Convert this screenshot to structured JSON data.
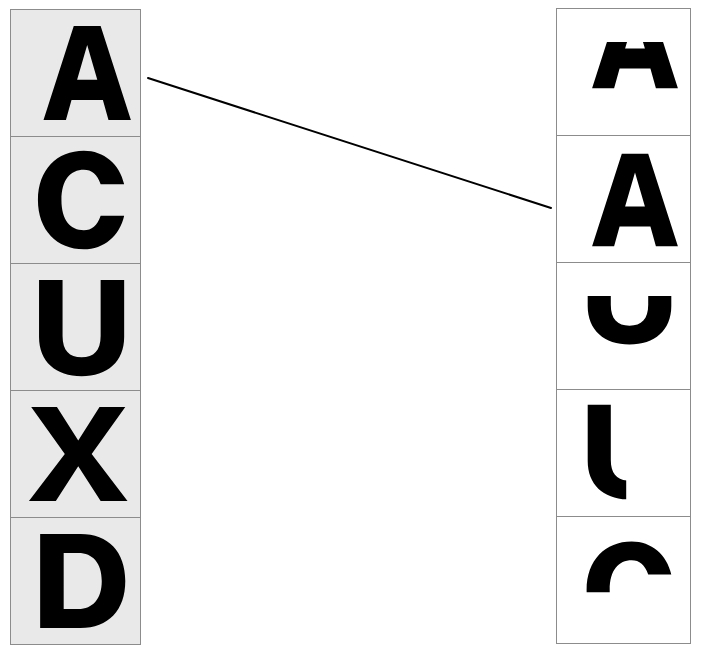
{
  "task": {
    "type": "letter-matching",
    "description": "Two vertical columns of letter cells joined by a connector line"
  },
  "left_column": {
    "name": "left-letter-column",
    "background_color": "#e9e9e9",
    "border_color": "#8c8c8c",
    "cells": [
      {
        "letter": "A",
        "clip": "full",
        "label": "A"
      },
      {
        "letter": "C",
        "clip": "full",
        "label": "C"
      },
      {
        "letter": "U",
        "clip": "full",
        "label": "U"
      },
      {
        "letter": "X",
        "clip": "full",
        "label": "X"
      },
      {
        "letter": "D",
        "clip": "full",
        "label": "D"
      }
    ]
  },
  "right_column": {
    "name": "right-letter-column",
    "background_color": "#ffffff",
    "border_color": "#8c8c8c",
    "cells": [
      {
        "letter": "A",
        "clip": "bottom-half",
        "label": "A"
      },
      {
        "letter": "A",
        "clip": "full",
        "label": "A"
      },
      {
        "letter": "U",
        "clip": "bottom-half",
        "label": "U"
      },
      {
        "letter": "U",
        "clip": "left-part",
        "label": "U"
      },
      {
        "letter": "C",
        "clip": "top-half",
        "label": "C"
      }
    ]
  },
  "connector": {
    "name": "match-connector-line",
    "color": "#000000",
    "width": 2,
    "from_cell": "left-cell-1",
    "to_cell": "right-cell-2",
    "x1": 148,
    "y1": 78,
    "x2": 551,
    "y2": 208
  },
  "colors": {
    "glyph": "#000000",
    "cell_border": "#8c8c8c",
    "left_cell_fill": "#e9e9e9",
    "right_cell_fill": "#ffffff",
    "page_background": "#ffffff"
  }
}
